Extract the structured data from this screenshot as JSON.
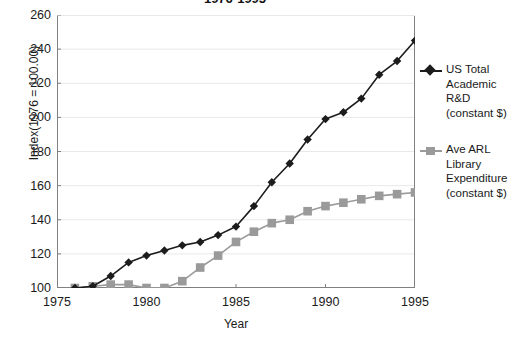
{
  "chart_data": {
    "type": "line",
    "title": "1976-1995",
    "xlabel": "Year",
    "ylabel": "Index(1976 = 100.00)",
    "x": [
      1976,
      1977,
      1978,
      1979,
      1980,
      1981,
      1982,
      1983,
      1984,
      1985,
      1986,
      1987,
      1988,
      1989,
      1990,
      1991,
      1992,
      1993,
      1994,
      1995
    ],
    "xlim": [
      1975,
      1995
    ],
    "ylim": [
      100,
      260
    ],
    "xticks": [
      "1975",
      "1980",
      "1985",
      "1990",
      "1995"
    ],
    "xtick_values": [
      1975,
      1980,
      1985,
      1990,
      1995
    ],
    "yticks": [
      "100",
      "120",
      "140",
      "160",
      "180",
      "200",
      "220",
      "240",
      "260"
    ],
    "ytick_values": [
      100,
      120,
      140,
      160,
      180,
      200,
      220,
      240,
      260
    ],
    "grid": "horizontal",
    "legend_position": "right",
    "series": [
      {
        "name": "US Total Academic R&D (constant $)",
        "legend_lines": [
          "US Total",
          "Academic",
          "R&D",
          "(constant $)"
        ],
        "marker": "diamond",
        "color": "#1c1c1c",
        "values": [
          100,
          101,
          107,
          115,
          119,
          122,
          125,
          127,
          131,
          136,
          148,
          162,
          173,
          187,
          199,
          203,
          211,
          225,
          233,
          245
        ]
      },
      {
        "name": "Ave ARL Library Expenditure (constant $)",
        "legend_lines": [
          "Ave ARL",
          "Library",
          "Expenditure",
          "(constant $)"
        ],
        "marker": "square",
        "color": "#9a9a9a",
        "values": [
          100,
          101,
          102,
          102,
          100,
          100,
          104,
          112,
          119,
          127,
          133,
          138,
          140,
          145,
          148,
          150,
          152,
          154,
          155,
          156
        ]
      }
    ]
  },
  "style": {
    "background": "#ffffff",
    "axis_color": "#808080",
    "grid_color": "#e8e8e8",
    "text_color": "#1a1a1a"
  }
}
